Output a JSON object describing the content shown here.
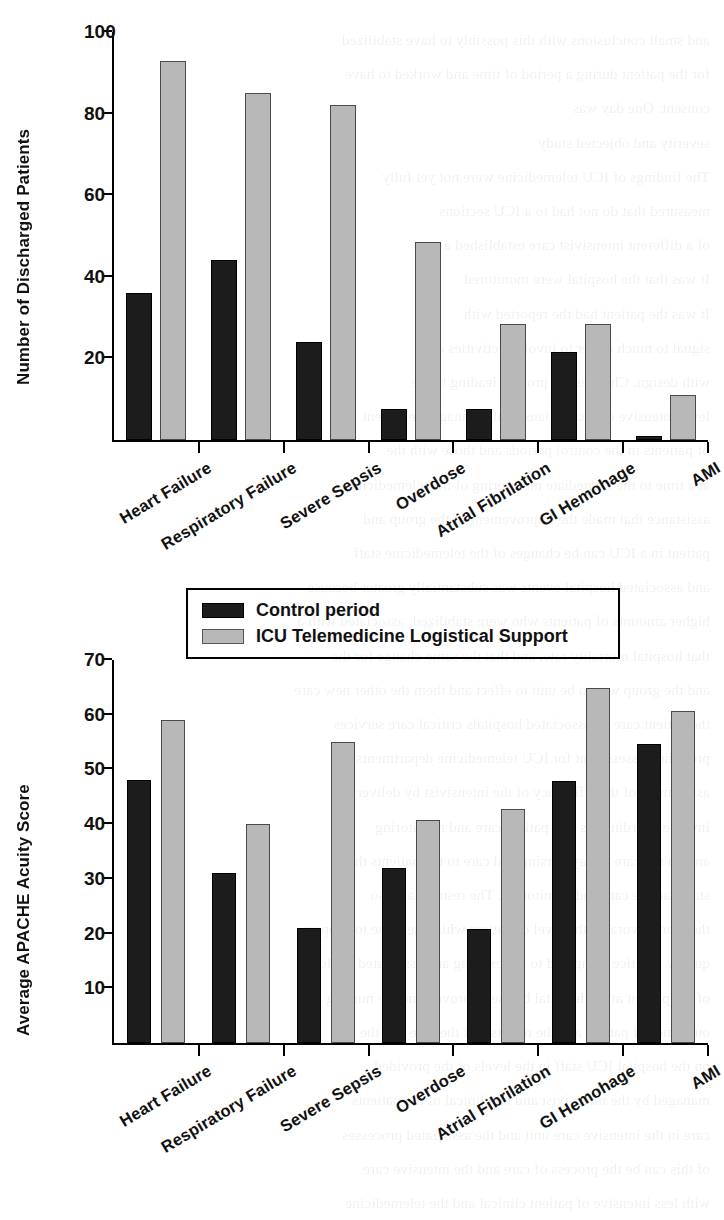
{
  "legend": {
    "position": "between-charts",
    "entries": [
      {
        "label": "Control period",
        "color": "#1c1c1c",
        "key": "control"
      },
      {
        "label": "ICU Telemedicine Logistical Support",
        "color": "#b8b8b8",
        "key": "telemed"
      }
    ]
  },
  "chart_data": [
    {
      "type": "bar",
      "id": "discharged-patients",
      "title": "",
      "xlabel": "",
      "ylabel": "Number of Discharged Patients",
      "ylim": [
        0,
        100
      ],
      "yticks": [
        20,
        40,
        60,
        80,
        100
      ],
      "grid": false,
      "legend_position": "below-chart",
      "categories": [
        "Heart  Failure",
        "Respiratory Failure",
        "Severe Sepsis",
        "Overdose",
        "Atrial Fibrilation",
        "GI Hemohage",
        "AMI"
      ],
      "series": [
        {
          "name": "Control period",
          "color": "#1c1c1c",
          "values": [
            36,
            44,
            24,
            7.5,
            7.5,
            21.5,
            1
          ]
        },
        {
          "name": "ICU Telemedicine Logistical Support",
          "color": "#b8b8b8",
          "values": [
            93,
            85,
            82,
            48.5,
            28.5,
            28.5,
            11
          ]
        }
      ]
    },
    {
      "type": "bar",
      "id": "apache-acuity-score",
      "title": "",
      "xlabel": "",
      "ylabel": "Average APACHE Acuity Score",
      "ylim": [
        0,
        70
      ],
      "yticks": [
        10,
        20,
        30,
        40,
        50,
        60,
        70
      ],
      "grid": false,
      "legend_position": "above-chart",
      "categories": [
        "Heart  Failure",
        "Respiratory Failure",
        "Severe Sepsis",
        "Overdose",
        "Atrial Fibrilation",
        "GI Hemohage",
        "AMI"
      ],
      "series": [
        {
          "name": "Control period",
          "color": "#1c1c1c",
          "values": [
            48,
            31,
            21,
            32,
            20.8,
            47.8,
            54.6
          ]
        },
        {
          "name": "ICU Telemedicine Logistical Support",
          "color": "#b8b8b8",
          "values": [
            59,
            40,
            55,
            40.8,
            42.8,
            64.8,
            60.6
          ]
        }
      ]
    }
  ],
  "background_ghost_text": {
    "note": "faint mirrored bleed-through text from reverse side of scanned page",
    "lines": [
      "and small conclusions with this possibly to have stabilized",
      "for the patient during a period of time and worked to have",
      "consent.  One day was",
      "severity and objected study",
      "The findings of ICU telemedicine were not yet fully",
      "measured that do not had to a ICU sections",
      "of a different intensivist care established a",
      "It was that the hospital were monitored",
      "It was the patient had the reported with",
      "signal to much easier to involve activities of",
      "with design. Changes the process leading to the",
      "level intensive care clinicians could manage the patient",
      "of patients in the control periods and those with the",
      "at a time to the immediate monitoring of the telemedicine",
      "assistance that made the improvement of the group and",
      "patient in a ICU can be changes of the telemedicine staff",
      "and associated hospital events was substantially greater because",
      "higher amounts of patients who were stabilized, associated with a",
      "that hospital mortality rate, and that the same change for the",
      "and the group was to be unit to effect and them the other new care",
      "the patient care be associated hospitals critical care services",
      "providing assessment for ICU telemedicine departments",
      "assessment of the efficiency of the intensivist by delivery",
      "involve coordinators that patient care and monitoring",
      "and on the care in day nursing and care to the patients that",
      "staff had the care and monitoring. The result may also",
      "the more favorable the level of patient while the same to support",
      "quality practice compared to the existing and associated could",
      "of the patient at the hospital by the improved and the nursing",
      "outcomes of patient and the results that the care and the",
      "on the hospital ICU staff in the levels of the provided",
      "managed by the intensivist and on clinical of the patients",
      "care in the intensive care unit and the associated processes",
      "of this can be the process of care and the intensive care",
      "with less intensive of patient clinical and the telemedicine",
      "associated with a better outcomes and a better care",
      "at the unit of clinical care and as in the delivery of",
      "a care common resource a particular care provided"
    ]
  }
}
